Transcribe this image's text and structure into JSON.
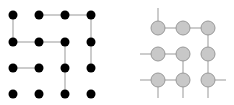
{
  "diagram": {
    "left_grid": {
      "description": "4x4 lattice of black dots with a light gray path",
      "dot_color": "#000000",
      "edge_color": "#bbbbbb",
      "cols_x": [
        13,
        39,
        65,
        91
      ],
      "rows_y": [
        15,
        42,
        68,
        94
      ],
      "dot_radius": 4.5
    },
    "right_grid": {
      "description": "3x3 lattice of gray circles with connecting edges and outward stubs",
      "node_fill": "#c8c8c8",
      "node_stroke": "#999999",
      "edge_color": "#999999",
      "cols_x": [
        158,
        183,
        208
      ],
      "rows_y": [
        28,
        54,
        80
      ],
      "node_radius": 7
    }
  }
}
